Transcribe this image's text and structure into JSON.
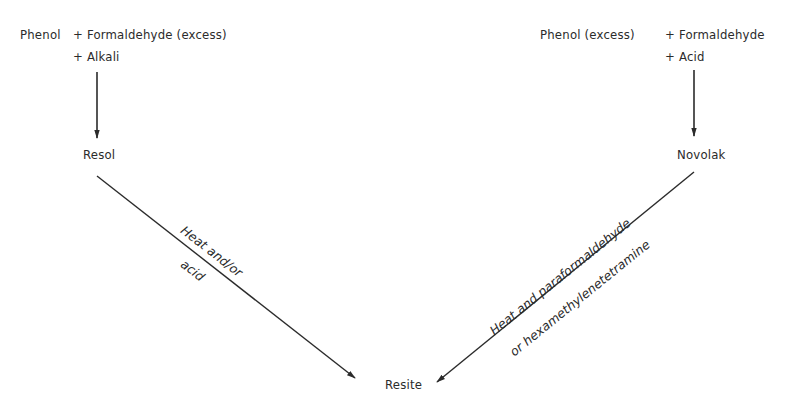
{
  "diagram": {
    "left_branch": {
      "reactants_line1_a": "Phenol",
      "reactants_line1_b": "+ Formaldehyde (excess)",
      "reactants_line2": "+ Alkali",
      "product": "Resol",
      "conversion_label_line1": "Heat and/or",
      "conversion_label_line2": "acid"
    },
    "right_branch": {
      "reactants_line1_a": "Phenol (excess)",
      "reactants_line1_b": "+ Formaldehyde",
      "reactants_line2": "+ Acid",
      "product": "Novolak",
      "conversion_label_line1": "Heat and paraformaldehyde",
      "conversion_label_line2": "or hexamethylenetetramine"
    },
    "final_product": "Resite",
    "colors": {
      "ink": "#2b2b2b",
      "background": "#ffffff"
    }
  }
}
